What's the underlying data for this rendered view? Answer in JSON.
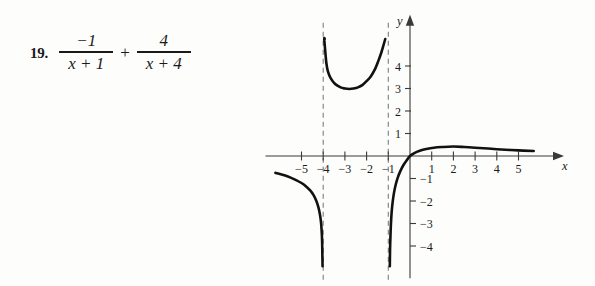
{
  "problem": {
    "number": "19.",
    "term1": {
      "numerator": "−1",
      "denominator": "x + 1"
    },
    "operator": "+",
    "term2": {
      "numerator": "4",
      "denominator": "x + 4"
    }
  },
  "chart_data": {
    "type": "line",
    "title": "",
    "xlabel": "x",
    "ylabel": "y",
    "xlim": [
      -6.2,
      5.9
    ],
    "ylim": [
      -4.9,
      5.3
    ],
    "grid": false,
    "legend": false,
    "expression": "-1/(x+1) + 4/(x+4)",
    "x_ticks": [
      -5,
      -4,
      -3,
      -2,
      -1,
      1,
      2,
      3,
      4,
      5
    ],
    "x_tick_labels": [
      "−5",
      "−4",
      "−3",
      "−2",
      "−1",
      "1",
      "2",
      "3",
      "4",
      "5"
    ],
    "y_ticks": [
      1,
      2,
      3,
      4,
      -1,
      -2,
      -3,
      -4
    ],
    "y_tick_labels": [
      "1",
      "2",
      "3",
      "4",
      "−1",
      "−2",
      "−3",
      "−4"
    ],
    "asymptotes": [
      {
        "type": "vertical",
        "x": -4,
        "style": "dashed"
      },
      {
        "type": "vertical",
        "x": -1,
        "style": "dashed"
      }
    ],
    "branches": [
      {
        "name": "left-branch",
        "domain": [
          -6.2,
          -4.05
        ],
        "points": [
          [
            -6.2,
            -0.75
          ],
          [
            -6.0,
            -0.8
          ],
          [
            -5.75,
            -0.87
          ],
          [
            -5.5,
            -0.96
          ],
          [
            -5.25,
            -1.07
          ],
          [
            -5.0,
            -1.2
          ],
          [
            -4.8,
            -1.34
          ],
          [
            -4.6,
            -1.53
          ],
          [
            -4.45,
            -1.73
          ],
          [
            -4.32,
            -1.99
          ],
          [
            -4.22,
            -2.28
          ],
          [
            -4.15,
            -2.6
          ],
          [
            -4.1,
            -2.95
          ],
          [
            -4.07,
            -3.35
          ],
          [
            -4.05,
            -3.8
          ],
          [
            -4.04,
            -4.3
          ],
          [
            -4.03,
            -4.9
          ]
        ]
      },
      {
        "name": "middle-branch",
        "domain": [
          -3.95,
          -1.05
        ],
        "points": [
          [
            -3.93,
            5.2
          ],
          [
            -3.95,
            5.2
          ],
          [
            -3.9,
            4.6
          ],
          [
            -3.85,
            4.1
          ],
          [
            -3.78,
            3.75
          ],
          [
            -3.65,
            3.45
          ],
          [
            -3.45,
            3.2
          ],
          [
            -3.2,
            3.05
          ],
          [
            -3.0,
            3.0
          ],
          [
            -2.8,
            2.98
          ],
          [
            -2.6,
            3.0
          ],
          [
            -2.4,
            3.05
          ],
          [
            -2.2,
            3.15
          ],
          [
            -2.0,
            3.33
          ],
          [
            -1.8,
            3.55
          ],
          [
            -1.62,
            3.85
          ],
          [
            -1.45,
            4.25
          ],
          [
            -1.32,
            4.6
          ],
          [
            -1.2,
            5.0
          ],
          [
            -1.14,
            5.2
          ]
        ]
      },
      {
        "name": "right-branch",
        "domain": [
          -0.95,
          5.8
        ],
        "points": [
          [
            -0.93,
            -4.9
          ],
          [
            -0.92,
            -4.2
          ],
          [
            -0.9,
            -3.55
          ],
          [
            -0.88,
            -3.05
          ],
          [
            -0.85,
            -2.55
          ],
          [
            -0.8,
            -2.05
          ],
          [
            -0.74,
            -1.65
          ],
          [
            -0.66,
            -1.28
          ],
          [
            -0.56,
            -0.95
          ],
          [
            -0.44,
            -0.66
          ],
          [
            -0.3,
            -0.4
          ],
          [
            -0.16,
            -0.2
          ],
          [
            0.0,
            0.0
          ],
          [
            0.2,
            0.13
          ],
          [
            0.45,
            0.23
          ],
          [
            0.75,
            0.31
          ],
          [
            1.1,
            0.37
          ],
          [
            1.5,
            0.4
          ],
          [
            2.0,
            0.42
          ],
          [
            2.5,
            0.4
          ],
          [
            3.0,
            0.37
          ],
          [
            3.6,
            0.33
          ],
          [
            4.2,
            0.29
          ],
          [
            5.0,
            0.25
          ],
          [
            5.7,
            0.22
          ]
        ]
      }
    ]
  }
}
